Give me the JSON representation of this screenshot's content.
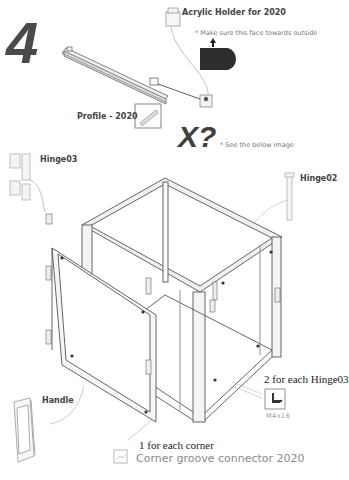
{
  "step": {
    "number": "4",
    "variable_marker": "X?"
  },
  "labels": {
    "acrylic_holder": "Acrylic Holder for 2020",
    "face_note": "* Make sure this face towards outside",
    "profile": "Profile - 2020",
    "see_below": "* See the below image",
    "hinge03": "Hinge03",
    "hinge02": "Hinge02",
    "handle": "Handle",
    "per_hinge": "2 for each Hinge03",
    "screw_spec": "M4x16",
    "per_corner": "1 for each corner",
    "corner_connector": "Corner groove connector 2020"
  },
  "colors": {
    "ink": "#444444",
    "frame_line": "#555555",
    "frame_fill": "#e8e8e8",
    "caption_gray": "#8a8a8a",
    "marker_dark": "#3a3a3a"
  }
}
